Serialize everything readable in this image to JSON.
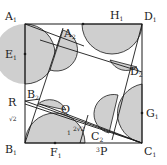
{
  "figure": {
    "colors": {
      "stroke": "#1a1a1a",
      "shade": "#cfcfcf",
      "background": "#ffffff"
    },
    "labels": {
      "A1": {
        "main": "A",
        "sub": "1"
      },
      "D1": {
        "main": "D",
        "sub": "1"
      },
      "B1": {
        "main": "B",
        "sub": "1"
      },
      "C1": {
        "main": "C",
        "sub": "1"
      },
      "A2": {
        "main": "A",
        "sub": "2"
      },
      "B2": {
        "main": "B",
        "sub": "2"
      },
      "C2": {
        "main": "C",
        "sub": "2"
      },
      "D2": {
        "main": "D",
        "sub": "2"
      },
      "E1": {
        "main": "E",
        "sub": "1"
      },
      "F1": {
        "main": "F",
        "sub": "1"
      },
      "G1": {
        "main": "G",
        "sub": "1"
      },
      "H1": {
        "main": "H",
        "sub": "1"
      },
      "R": {
        "main": "R",
        "sub": ""
      },
      "Q": {
        "main": "Q",
        "sub": ""
      },
      "P": {
        "main": "P",
        "sub": ""
      }
    },
    "measurements": {
      "R_B1": "√2",
      "F1_Q": "1",
      "Q_C2": "2√2",
      "P_mark": "3"
    }
  }
}
